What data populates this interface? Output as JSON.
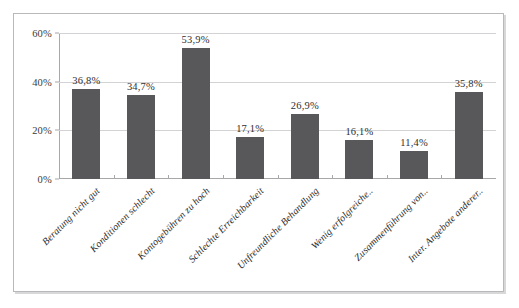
{
  "chart_data": {
    "type": "bar",
    "title": "",
    "subtitle": "",
    "xlabel": "",
    "ylabel": "",
    "ylim": [
      0,
      60
    ],
    "yticks": [
      "0%",
      "20%",
      "40%",
      "60%"
    ],
    "ytick_values": [
      0,
      20,
      40,
      60
    ],
    "grid": true,
    "legend": null,
    "legend_position": "none",
    "categories": [
      "Beratung nicht gut",
      "Konditionen schlecht",
      "Kontogebühren zu hoch",
      "Schlechte Erreichbarkeit",
      "Unfreundliche Behandlung",
      "Wenig erfolgreiche..",
      "Zusammenführung von..",
      "Inter. Angebote anderer.."
    ],
    "values": [
      36.8,
      34.7,
      53.9,
      17.1,
      26.9,
      16.1,
      11.4,
      35.8
    ],
    "value_labels": [
      "36,8%",
      "34,7%",
      "53,9%",
      "17,1%",
      "26,9%",
      "16,1%",
      "11,4%",
      "35,8%"
    ],
    "bar_color": "#58585a",
    "plot_background": "#ffffff",
    "gridline_color": "#d3d3d6",
    "axis_color": "#a8a8ab",
    "frame_border_color": "#b9b9bb"
  }
}
